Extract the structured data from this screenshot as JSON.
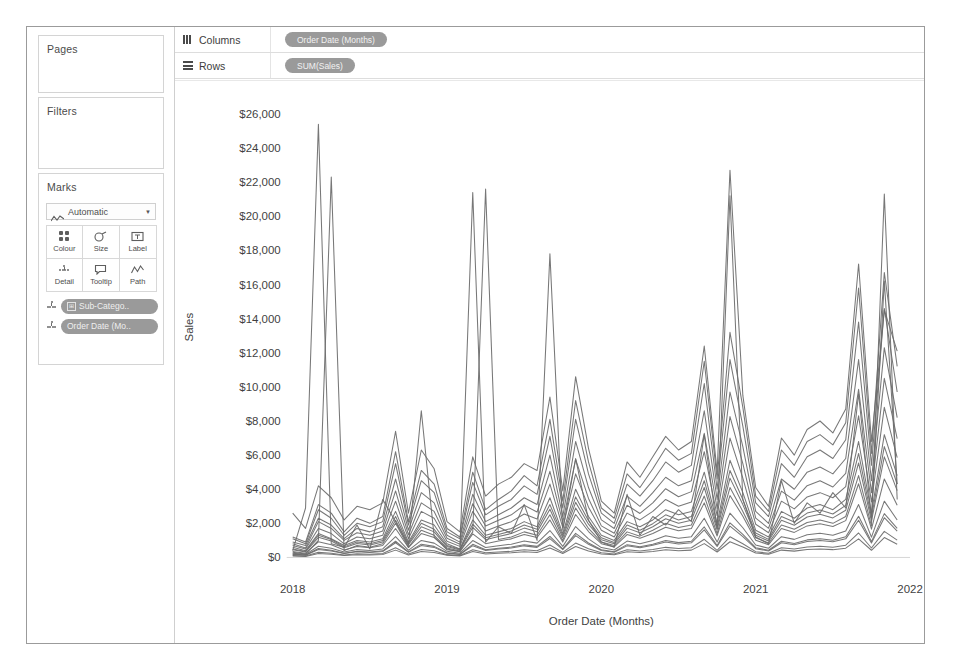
{
  "panels": {
    "pages": {
      "title": "Pages"
    },
    "filters": {
      "title": "Filters"
    },
    "marks": {
      "title": "Marks",
      "mark_type": "Automatic",
      "mark_type_icon": "line-wave-icon",
      "dropdown_caret": "▼",
      "buttons": [
        {
          "label": "Colour",
          "icon": "colour-swatches-icon"
        },
        {
          "label": "Size",
          "icon": "size-icon"
        },
        {
          "label": "Label",
          "icon": "label-icon"
        },
        {
          "label": "Detail",
          "icon": "detail-dots-icon"
        },
        {
          "label": "Tooltip",
          "icon": "tooltip-icon"
        },
        {
          "label": "Path",
          "icon": "path-wave-icon"
        }
      ],
      "pills": [
        {
          "label": "Sub-Catego..",
          "icon": "detail-dots-icon",
          "has_expand": true,
          "expand_glyph": "⊞"
        },
        {
          "label": "Order Date (Mo..",
          "icon": "detail-dots-icon",
          "has_expand": false,
          "expand_glyph": ""
        }
      ]
    }
  },
  "shelves": [
    {
      "name": "Columns",
      "icon": "columns-icon",
      "pill": "Order Date (Months)"
    },
    {
      "name": "Rows",
      "icon": "rows-icon",
      "pill": "SUM(Sales)"
    }
  ],
  "colors": {
    "line": "#6b6b6b",
    "pill_bg": "#9a9a9a",
    "pill_text": "#efefef",
    "axis_text": "#3f3f3f",
    "frame_border": "#9b9b9b",
    "card_border": "#d4d4d4",
    "panel_bg": "#ffffff"
  },
  "chart_data": {
    "type": "line",
    "title": "",
    "xlabel": "Order Date (Months)",
    "ylabel": "Sales",
    "grid": false,
    "legend": "none",
    "x_tick_labels": [
      "2018",
      "2019",
      "2020",
      "2021",
      "2022"
    ],
    "x_tick_values": [
      0,
      12,
      24,
      36,
      48
    ],
    "xlim": [
      0,
      48
    ],
    "y_tick_labels": [
      "$0",
      "$2,000",
      "$4,000",
      "$6,000",
      "$8,000",
      "$10,000",
      "$12,000",
      "$14,000",
      "$16,000",
      "$18,000",
      "$20,000",
      "$22,000",
      "$24,000",
      "$26,000"
    ],
    "y_tick_values": [
      0,
      2000,
      4000,
      6000,
      8000,
      10000,
      12000,
      14000,
      16000,
      18000,
      20000,
      22000,
      24000,
      26000
    ],
    "ylim": [
      0,
      27000
    ],
    "x_unit": "month index from Jan 2018",
    "series": [
      {
        "name": "Phones",
        "values": [
          1200,
          900,
          3100,
          2600,
          1500,
          2300,
          2000,
          2400,
          6200,
          2100,
          5100,
          4300,
          1700,
          1200,
          5000,
          2800,
          3400,
          3900,
          4800,
          4200,
          8100,
          3300,
          9200,
          5600,
          2900,
          2300,
          4900,
          4100,
          5200,
          6400,
          5700,
          6100,
          11500,
          4600,
          13200,
          8800,
          3600,
          2700,
          6300,
          5400,
          6800,
          7200,
          6600,
          7900,
          15800,
          6100,
          16700,
          11200
        ]
      },
      {
        "name": "Chairs",
        "values": [
          2600,
          1700,
          4200,
          3500,
          2200,
          3000,
          2800,
          3200,
          7400,
          2600,
          6300,
          5200,
          2100,
          1500,
          5900,
          3600,
          4300,
          4700,
          5500,
          5100,
          9400,
          3900,
          10600,
          6400,
          3300,
          2600,
          5600,
          4700,
          5900,
          7100,
          6300,
          6800,
          12400,
          5000,
          22700,
          9500,
          4100,
          3000,
          7000,
          6000,
          7500,
          8000,
          7300,
          8700,
          17200,
          6800,
          14500,
          12100
        ]
      },
      {
        "name": "Storage",
        "values": [
          900,
          700,
          2300,
          1900,
          1100,
          1700,
          1500,
          1800,
          4600,
          1600,
          3800,
          3200,
          1300,
          900,
          3700,
          2100,
          2500,
          2900,
          3500,
          3100,
          6000,
          2400,
          6800,
          4100,
          2200,
          1700,
          3600,
          3000,
          3800,
          4700,
          4200,
          4500,
          8600,
          3400,
          9700,
          6500,
          2700,
          2000,
          4600,
          4000,
          5000,
          5300,
          4900,
          5800,
          11600,
          4500,
          12300,
          8200
        ]
      },
      {
        "name": "Binders",
        "values": [
          600,
          400,
          1400,
          1100,
          700,
          1000,
          900,
          1100,
          2700,
          900,
          2200,
          1900,
          800,
          500,
          2200,
          1300,
          1500,
          1700,
          2100,
          1800,
          3500,
          1400,
          4000,
          2400,
          1300,
          1000,
          2100,
          1800,
          2200,
          2800,
          2500,
          2700,
          5000,
          2000,
          5700,
          3800,
          1600,
          1200,
          2700,
          2300,
          2900,
          3100,
          2800,
          3400,
          6800,
          2600,
          7200,
          4800
        ]
      },
      {
        "name": "Tables",
        "values": [
          1100,
          800,
          2800,
          2300,
          1300,
          2000,
          1800,
          2100,
          5500,
          1900,
          4500,
          3800,
          1500,
          1100,
          4400,
          2500,
          3000,
          3400,
          4200,
          3700,
          7100,
          2900,
          8100,
          4900,
          2600,
          2000,
          4300,
          3600,
          4500,
          5600,
          5000,
          5400,
          10200,
          4000,
          11600,
          7700,
          3200,
          2400,
          5500,
          4700,
          5900,
          6300,
          5800,
          6900,
          13800,
          5400,
          14600,
          9700
        ]
      },
      {
        "name": "Accessories",
        "values": [
          700,
          500,
          1700,
          1400,
          800,
          1200,
          1100,
          1300,
          3300,
          1100,
          2700,
          2300,
          950,
          650,
          2700,
          1550,
          1850,
          2100,
          2550,
          2250,
          4300,
          1750,
          4900,
          2950,
          1600,
          1200,
          2600,
          2200,
          2700,
          3400,
          3000,
          3250,
          6200,
          2450,
          7000,
          4650,
          1950,
          1450,
          3300,
          2850,
          3550,
          3800,
          3500,
          4150,
          8300,
          3250,
          8800,
          5850
        ]
      },
      {
        "name": "Machines",
        "values": [
          400,
          2900,
          25400,
          800,
          600,
          1900,
          500,
          3400,
          2100,
          700,
          8600,
          1200,
          450,
          350,
          21400,
          900,
          1800,
          1400,
          3100,
          1000,
          17800,
          1600,
          5800,
          2200,
          900,
          600,
          3700,
          1300,
          2400,
          1900,
          2800,
          2100,
          7200,
          1700,
          21200,
          3400,
          1200,
          800,
          4500,
          2000,
          3200,
          2600,
          3800,
          2900,
          9600,
          2300,
          16200,
          4300
        ]
      },
      {
        "name": "Copiers",
        "values": [
          300,
          200,
          1000,
          22300,
          400,
          700,
          600,
          800,
          2000,
          600,
          1600,
          1300,
          550,
          380,
          1500,
          21600,
          1050,
          1200,
          1500,
          1300,
          2500,
          1000,
          2900,
          1700,
          900,
          700,
          1500,
          1250,
          1600,
          2000,
          1750,
          1900,
          3600,
          1400,
          4100,
          2700,
          1150,
          850,
          1900,
          1650,
          2050,
          2200,
          2000,
          2400,
          4800,
          1850,
          21300,
          3400
        ]
      },
      {
        "name": "Bookcases",
        "values": [
          500,
          350,
          1300,
          1050,
          620,
          900,
          800,
          1000,
          2400,
          820,
          2000,
          1650,
          700,
          480,
          1950,
          1150,
          1350,
          1550,
          1900,
          1650,
          3100,
          1280,
          3550,
          2150,
          1150,
          880,
          1900,
          1600,
          1980,
          2500,
          2200,
          2400,
          4500,
          1780,
          5100,
          3400,
          1430,
          1060,
          2400,
          2080,
          2600,
          2780,
          2550,
          3050,
          6100,
          2350,
          6500,
          4300
        ]
      },
      {
        "name": "Appliances",
        "values": [
          800,
          560,
          2100,
          1700,
          1000,
          1450,
          1300,
          1550,
          3900,
          1330,
          3200,
          2700,
          1130,
          780,
          3150,
          1850,
          2180,
          2500,
          3060,
          2660,
          5050,
          2060,
          5750,
          3460,
          1850,
          1420,
          3060,
          2580,
          3200,
          4030,
          3560,
          3860,
          7280,
          2870,
          8260,
          5500,
          2310,
          1710,
          3890,
          3360,
          4210,
          4500,
          4130,
          4930,
          9860,
          3800,
          10500,
          6970
        ]
      },
      {
        "name": "Furnishings",
        "values": [
          450,
          320,
          1180,
          960,
          570,
          820,
          730,
          900,
          2180,
          750,
          1800,
          1500,
          640,
          440,
          1770,
          1040,
          1230,
          1400,
          1720,
          1500,
          2830,
          1160,
          3230,
          1950,
          1040,
          800,
          1720,
          1450,
          1800,
          2270,
          2000,
          2180,
          4100,
          1620,
          4650,
          3100,
          1300,
          960,
          2180,
          1890,
          2370,
          2530,
          2320,
          2770,
          5540,
          2130,
          5900,
          3920
        ]
      },
      {
        "name": "Paper",
        "values": [
          350,
          250,
          920,
          750,
          440,
          640,
          570,
          700,
          1700,
          580,
          1400,
          1170,
          500,
          340,
          1380,
          810,
          960,
          1090,
          1340,
          1170,
          2200,
          900,
          2520,
          1520,
          810,
          620,
          1340,
          1130,
          1400,
          1770,
          1560,
          1700,
          3200,
          1260,
          3630,
          2420,
          1010,
          750,
          1700,
          1470,
          1850,
          1970,
          1810,
          2160,
          4320,
          1660,
          4600,
          3060
        ]
      },
      {
        "name": "Supplies",
        "values": [
          250,
          180,
          660,
          540,
          320,
          460,
          410,
          500,
          1220,
          420,
          1000,
          840,
          360,
          250,
          990,
          580,
          690,
          780,
          960,
          840,
          1580,
          650,
          1810,
          1090,
          580,
          440,
          960,
          810,
          1000,
          1270,
          1120,
          1220,
          2300,
          900,
          2600,
          1740,
          730,
          540,
          1220,
          1060,
          1330,
          1420,
          1300,
          1550,
          3100,
          1190,
          3300,
          2200
        ]
      },
      {
        "name": "Art",
        "values": [
          200,
          140,
          520,
          420,
          250,
          360,
          320,
          390,
          950,
          330,
          780,
          650,
          280,
          190,
          770,
          450,
          540,
          610,
          750,
          650,
          1230,
          500,
          1410,
          850,
          450,
          340,
          750,
          630,
          780,
          990,
          870,
          950,
          1790,
          700,
          2030,
          1350,
          570,
          420,
          950,
          820,
          1030,
          1100,
          1010,
          1210,
          2410,
          930,
          2570,
          1710
        ]
      },
      {
        "name": "Envelopes",
        "values": [
          180,
          130,
          470,
          380,
          230,
          330,
          290,
          350,
          860,
          300,
          700,
          590,
          250,
          175,
          690,
          410,
          490,
          550,
          680,
          590,
          1110,
          455,
          1280,
          770,
          410,
          310,
          680,
          570,
          710,
          900,
          790,
          860,
          1620,
          640,
          1840,
          1220,
          515,
          380,
          860,
          745,
          930,
          1000,
          915,
          1090,
          2180,
          845,
          2330,
          1550
        ]
      },
      {
        "name": "Fasteners",
        "values": [
          90,
          60,
          230,
          190,
          110,
          160,
          145,
          175,
          430,
          150,
          350,
          295,
          125,
          88,
          345,
          205,
          245,
          275,
          340,
          295,
          555,
          228,
          640,
          385,
          205,
          155,
          340,
          285,
          355,
          450,
          395,
          430,
          810,
          320,
          920,
          610,
          258,
          190,
          430,
          372,
          465,
          500,
          458,
          545,
          1090,
          422,
          1165,
          775
        ]
      },
      {
        "name": "Labels",
        "values": [
          120,
          85,
          310,
          250,
          150,
          215,
          190,
          235,
          570,
          197,
          465,
          390,
          165,
          116,
          455,
          270,
          322,
          362,
          447,
          390,
          730,
          300,
          842,
          507,
          270,
          204,
          447,
          375,
          467,
          592,
          520,
          566,
          1066,
          421,
          1211,
          803,
          340,
          250,
          566,
          490,
          612,
          658,
          603,
          717,
          1435,
          556,
          1533,
          1020
        ]
      }
    ]
  }
}
